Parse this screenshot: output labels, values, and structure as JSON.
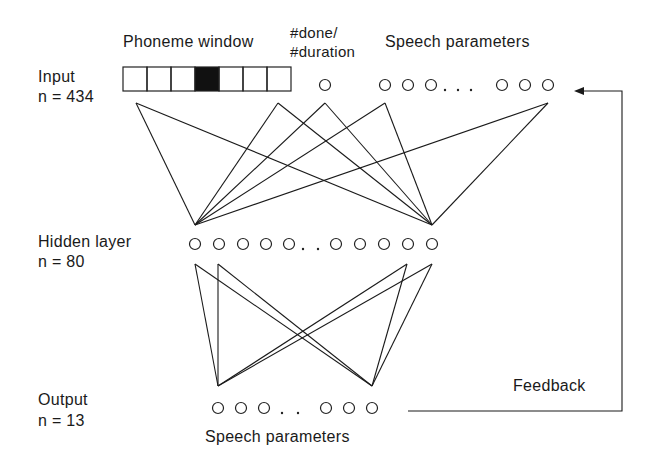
{
  "layers": {
    "input": {
      "name": "Input",
      "count_label": "n = 434"
    },
    "hidden": {
      "name": "Hidden layer",
      "count_label": "n = 80"
    },
    "output": {
      "name": "Output",
      "count_label": "n = 13"
    }
  },
  "input_groups": {
    "phoneme_window": {
      "label": "Phoneme window",
      "cells": 7,
      "active_cell_index": 3
    },
    "done_duration": {
      "label_line1": "#done/",
      "label_line2": "#duration"
    },
    "speech_parameters": {
      "label": "Speech parameters",
      "ellipsis": "..."
    }
  },
  "hidden_row": {
    "ellipsis": ".."
  },
  "output_row": {
    "label": "Speech parameters",
    "ellipsis": ".."
  },
  "feedback": {
    "label": "Feedback"
  },
  "colors": {
    "ink": "#1a1a1a",
    "background": "#ffffff",
    "active_cell": "#111111"
  }
}
